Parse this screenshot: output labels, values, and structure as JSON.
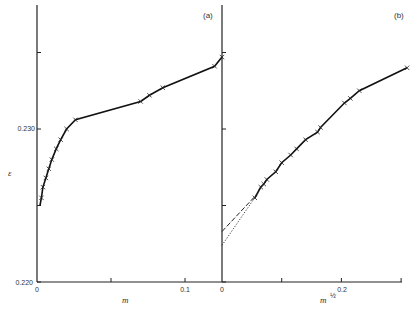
{
  "chart_data": [
    {
      "panel": "(a)",
      "type": "line",
      "xlabel": "m",
      "ylabel": "ε",
      "xlim": [
        0,
        0.125
      ],
      "ylim": [
        0.22,
        0.236
      ],
      "x_ticks": [
        "0",
        "0.05",
        "0.1"
      ],
      "x_tick_labels": [
        "0",
        "",
        "0.1"
      ],
      "y_ticks": [
        0.22,
        0.225,
        0.23,
        0.235
      ],
      "y_tick_labels": [
        "0.220",
        "",
        "0.230",
        ""
      ],
      "series": [
        {
          "name": "measured",
          "marker": "x",
          "x": [
            0.003,
            0.004,
            0.006,
            0.008,
            0.01,
            0.013,
            0.016,
            0.02,
            0.026,
            0.07,
            0.076,
            0.085,
            0.12,
            0.125
          ],
          "y": [
            0.2255,
            0.2262,
            0.2268,
            0.2274,
            0.228,
            0.2287,
            0.2293,
            0.23,
            0.2306,
            0.2318,
            0.2322,
            0.2327,
            0.2341,
            0.2347
          ]
        }
      ]
    },
    {
      "panel": "(b)",
      "type": "line",
      "xlabel": "m^½",
      "ylabel": "ε",
      "xlim": [
        0,
        0.3
      ],
      "ylim": [
        0.22,
        0.236
      ],
      "x_ticks": [
        0,
        0.1,
        0.2,
        0.3
      ],
      "x_tick_labels": [
        "0",
        "",
        "0.2",
        ""
      ],
      "series": [
        {
          "name": "measured",
          "marker": "x",
          "x": [
            0.055,
            0.065,
            0.07,
            0.075,
            0.09,
            0.1,
            0.115,
            0.125,
            0.14,
            0.16,
            0.165,
            0.205,
            0.215,
            0.23,
            0.31
          ],
          "y": [
            0.2255,
            0.2262,
            0.2264,
            0.2267,
            0.2272,
            0.2278,
            0.2283,
            0.2287,
            0.2293,
            0.2298,
            0.2301,
            0.2317,
            0.232,
            0.2325,
            0.234
          ]
        },
        {
          "name": "linear extrapolation (dashed)",
          "x": [
            0,
            0.06
          ],
          "y": [
            0.2233,
            0.2258
          ]
        },
        {
          "name": "curved extrapolation (dotted)",
          "x": [
            0,
            0.06
          ],
          "y": [
            0.2224,
            0.2258
          ]
        }
      ]
    }
  ],
  "labels": {
    "panel_a": "(a)",
    "panel_b": "(b)",
    "y_axis": "ε",
    "x_axis_a": "m",
    "x_axis_b": "m",
    "x_axis_b_exp": "½",
    "y0": "0.220",
    "y1": "0.230",
    "xa0": "0",
    "xa1": "0.1",
    "xb0": "0",
    "xb1": "0.2"
  }
}
